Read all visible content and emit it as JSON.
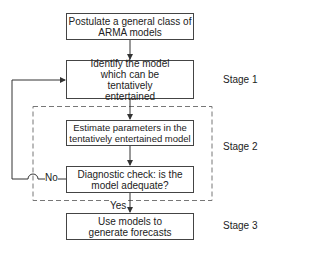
{
  "boxes": [
    {
      "id": "postulate",
      "text": "Postulate a general class of ARMA models"
    },
    {
      "id": "identify",
      "text": "Identify the model which can be tentatively entertained"
    },
    {
      "id": "estimate",
      "text": "Estimate parameters in the tentatively entertained model"
    },
    {
      "id": "diagnostic",
      "text": "Diagnostic check: is the model adequate?"
    },
    {
      "id": "forecast",
      "text": "Use models to generate forecasts"
    }
  ],
  "stages": [
    "Stage 1",
    "Stage 2",
    "Stage 3"
  ],
  "edge_labels": {
    "no": "No",
    "yes": "Yes"
  }
}
